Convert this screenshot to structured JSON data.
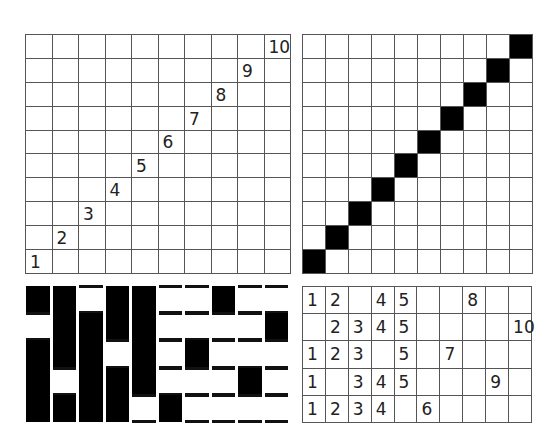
{
  "panels": {
    "numbered_diagonal": {
      "rows": 10,
      "cols": 10,
      "labels": [
        "1",
        "2",
        "3",
        "4",
        "5",
        "6",
        "7",
        "8",
        "9",
        "10"
      ]
    },
    "filled_diagonal": {
      "rows": 10,
      "cols": 10,
      "filled_color": "#000000"
    },
    "weave_draft": {
      "rows": 5,
      "cols": 10,
      "black_cols_by_row": [
        [
          1,
          2,
          4,
          5,
          8
        ],
        [
          2,
          3,
          4,
          5,
          10
        ],
        [
          1,
          2,
          3,
          5,
          7
        ],
        [
          1,
          3,
          4,
          5,
          9
        ],
        [
          1,
          2,
          3,
          4,
          6
        ]
      ]
    },
    "number_table": {
      "rows": 5,
      "cols": 10,
      "cells": [
        [
          "1",
          "2",
          "",
          "4",
          "5",
          "",
          "",
          "8",
          "",
          ""
        ],
        [
          "",
          "2",
          "3",
          "4",
          "5",
          "",
          "",
          "",
          "",
          "10"
        ],
        [
          "1",
          "2",
          "3",
          "",
          "5",
          "",
          "7",
          "",
          "",
          ""
        ],
        [
          "1",
          "",
          "3",
          "4",
          "5",
          "",
          "",
          "",
          "9",
          ""
        ],
        [
          "1",
          "2",
          "3",
          "4",
          "",
          "6",
          "",
          "",
          "",
          ""
        ]
      ]
    }
  }
}
